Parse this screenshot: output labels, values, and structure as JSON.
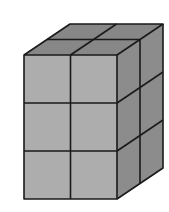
{
  "figure": {
    "description": "Rectangular prism built from unit cubes",
    "dimensions": {
      "width_cubes": 2,
      "depth_cubes": 2,
      "height_cubes": 3
    },
    "total_cubes": 12,
    "colors": {
      "front": "#adadad",
      "top": "#878787",
      "side": "#8c8c8c",
      "edge": "#1a1a1a",
      "background": "#ffffff"
    }
  }
}
